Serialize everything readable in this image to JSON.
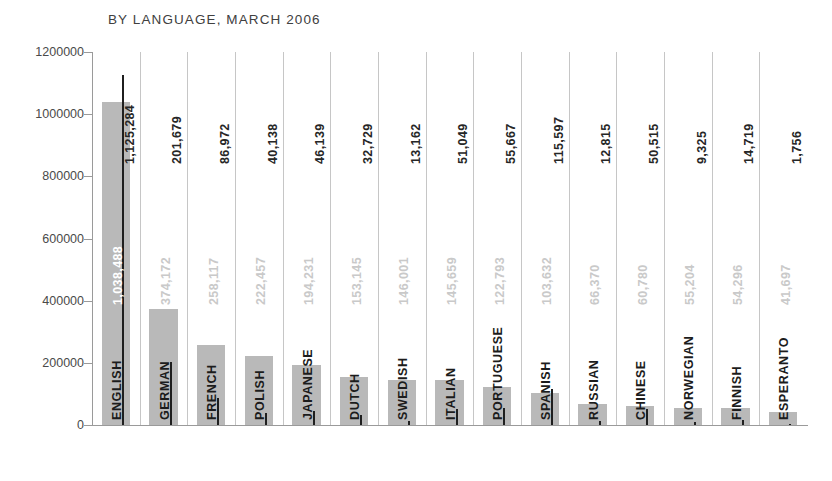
{
  "chart_data": {
    "type": "bar",
    "title": "BY LANGUAGE, MARCH 2006",
    "xlabel": "",
    "ylabel": "",
    "ylim": [
      0,
      1200000
    ],
    "ytick_labels": [
      "1200000",
      "1000000",
      "800000",
      "600000",
      "400000",
      "200000",
      "0"
    ],
    "yticks": [
      1200000,
      1000000,
      800000,
      600000,
      400000,
      200000,
      0
    ],
    "grid": false,
    "legend_position": "none",
    "categories": [
      "ENGLISH",
      "GERMAN",
      "FRENCH",
      "POLISH",
      "JAPANESE",
      "DUTCH",
      "SWEDISH",
      "ITALIAN",
      "PORTUGUESE",
      "SPANISH",
      "RUSSIAN",
      "CHINESE",
      "NORWEGIAN",
      "FINNISH",
      "ESPERANTO"
    ],
    "series": [
      {
        "name": "articles",
        "style": "gray-bar",
        "values": [
          1038488,
          374172,
          258117,
          222457,
          194231,
          153145,
          146001,
          145659,
          122793,
          103632,
          66370,
          60780,
          55204,
          54296,
          41697
        ],
        "labels": [
          "1,038,488",
          "374,172",
          "258,117",
          "222,457",
          "194,231",
          "153,145",
          "146,001",
          "145,659",
          "122,793",
          "103,632",
          "66,370",
          "60,780",
          "55,204",
          "54,296",
          "41,697"
        ]
      },
      {
        "name": "second-measure",
        "style": "black-line",
        "values": [
          1125284,
          201679,
          86972,
          40138,
          46139,
          32729,
          13162,
          51049,
          55667,
          115597,
          12815,
          50515,
          9325,
          14719,
          1756
        ],
        "labels": [
          "1,125,284",
          "201,679",
          "86,972",
          "40,138",
          "46,139",
          "32,729",
          "13,162",
          "51,049",
          "55,667",
          "115,597",
          "12,815",
          "50,515",
          "9,325",
          "14,719",
          "1,756"
        ]
      }
    ]
  },
  "colors": {
    "bar_gray": "#b9b9b9",
    "line_black": "#1f1f1f",
    "gray_label": "#c9c9c9",
    "black_label": "#262626",
    "axis": "#9a9a9a",
    "separator": "#c6c6c6",
    "background": "#ffffff"
  }
}
